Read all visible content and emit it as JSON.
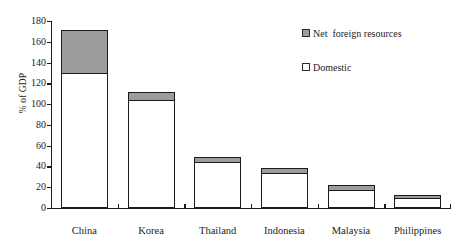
{
  "chart_data": {
    "type": "bar",
    "subtype": "stacked-vertical",
    "title": "",
    "xlabel": "",
    "ylabel": "% of GDP",
    "categories": [
      "China",
      "Korea",
      "Thailand",
      "Indonesia",
      "Malaysia",
      "Philippines"
    ],
    "series": [
      {
        "name": "Domestic",
        "values": [
          130,
          104,
          44,
          34,
          17,
          10
        ],
        "color": "#ffffff"
      },
      {
        "name": "Net  foreign resources",
        "values": [
          41,
          8,
          5,
          5,
          5,
          3
        ],
        "color": "#9c9c9c"
      }
    ],
    "totals": [
      171,
      112,
      49,
      39,
      22,
      13
    ],
    "ylim": [
      0,
      180
    ],
    "ytick_step": 20,
    "yticks": [
      0,
      20,
      40,
      60,
      80,
      100,
      120,
      140,
      160,
      180
    ],
    "ytick_labels": [
      "0",
      "20",
      "40",
      "60",
      "80",
      "100",
      "120",
      "140",
      "160",
      "180"
    ],
    "grid": false,
    "legend_position": "upper right",
    "legend_entries": [
      {
        "label": "Net  foreign resources",
        "swatch": "gray"
      },
      {
        "label": "Domestic",
        "swatch": "white"
      }
    ]
  }
}
